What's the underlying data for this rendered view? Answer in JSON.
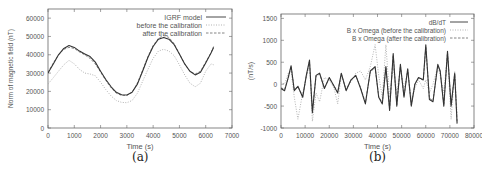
{
  "figure": {
    "panels": [
      {
        "caption": "(a)"
      },
      {
        "caption": "(b)"
      }
    ]
  },
  "chart_data": [
    {
      "type": "line",
      "panel": "(a)",
      "title": "",
      "xlabel": "Time (s)",
      "ylabel": "Norm of magnetic field (nT)",
      "xlim": [
        0,
        7000
      ],
      "ylim": [
        0,
        65000
      ],
      "xticks": [
        0,
        1000,
        2000,
        3000,
        4000,
        5000,
        6000,
        7000
      ],
      "yticks": [
        0,
        10000,
        20000,
        30000,
        40000,
        50000,
        60000
      ],
      "xtick_labels": [
        "0",
        "1000",
        "2000",
        "3000",
        "4000",
        "5000",
        "6000",
        "7000"
      ],
      "ytick_labels": [
        "0",
        "10000",
        "20000",
        "30000",
        "40000",
        "50000",
        "60000"
      ],
      "grid": false,
      "legend_position": "top-right",
      "x": [
        0,
        200,
        400,
        600,
        800,
        1000,
        1200,
        1400,
        1600,
        1800,
        2000,
        2200,
        2400,
        2600,
        2800,
        3000,
        3200,
        3400,
        3600,
        3800,
        4000,
        4200,
        4400,
        4600,
        4800,
        5000,
        5200,
        5400,
        5600,
        5800,
        6000,
        6200,
        6300
      ],
      "series": [
        {
          "name": "IGRF model",
          "style": "solid",
          "color": "#333333",
          "values": [
            30000,
            35000,
            40000,
            43500,
            45000,
            44000,
            42000,
            40500,
            39000,
            36000,
            31000,
            26500,
            22500,
            19500,
            18200,
            18000,
            19500,
            24000,
            31000,
            38500,
            44500,
            48500,
            49500,
            48500,
            45500,
            40500,
            35000,
            31000,
            29000,
            30500,
            35500,
            41000,
            44000
          ]
        },
        {
          "name": "before the calibration",
          "style": "dotted",
          "color": "#aaaaaa",
          "values": [
            24000,
            27500,
            31000,
            34500,
            37000,
            35000,
            32000,
            30000,
            29500,
            28500,
            25000,
            21000,
            17500,
            15000,
            14000,
            13800,
            15000,
            19000,
            25500,
            32000,
            38000,
            42000,
            43000,
            42000,
            39500,
            34500,
            29000,
            24500,
            22500,
            24500,
            31000,
            35000,
            34500
          ]
        },
        {
          "name": "after the calibration",
          "style": "dashed",
          "color": "#777777",
          "values": [
            30500,
            35500,
            40000,
            43000,
            44000,
            43500,
            41500,
            40000,
            38000,
            35000,
            30500,
            26000,
            22000,
            19000,
            17800,
            17800,
            19500,
            24500,
            31500,
            39000,
            45000,
            49000,
            50500,
            49500,
            46000,
            40500,
            35000,
            31000,
            29500,
            31000,
            36000,
            41000,
            44500
          ]
        }
      ]
    },
    {
      "type": "line",
      "panel": "(b)",
      "title": "",
      "xlabel": "Time (s)",
      "ylabel": "(nT/s)",
      "xlim": [
        0,
        80000
      ],
      "ylim": [
        -1000,
        1600
      ],
      "xticks": [
        0,
        10000,
        20000,
        30000,
        40000,
        50000,
        60000,
        70000,
        80000
      ],
      "yticks": [
        -1000,
        -500,
        0,
        500,
        1000,
        1500
      ],
      "xtick_labels": [
        "0",
        "10000",
        "20000",
        "30000",
        "40000",
        "50000",
        "60000",
        "70000",
        "80000"
      ],
      "ytick_labels": [
        "-1000",
        "-500",
        "0",
        "500",
        "1000",
        "1500"
      ],
      "grid": false,
      "legend_position": "top-right",
      "x": [
        0,
        1500,
        3000,
        4200,
        5500,
        7000,
        9000,
        10500,
        11800,
        13000,
        14500,
        16000,
        18000,
        20000,
        22000,
        23500,
        25000,
        27000,
        29000,
        31000,
        33000,
        35000,
        37000,
        39000,
        40500,
        42000,
        43500,
        45000,
        46500,
        48000,
        49500,
        51000,
        52500,
        54000,
        55500,
        57000,
        59000,
        60000,
        61500,
        63000,
        65000,
        66000,
        67500,
        69000,
        70500,
        72000,
        73000
      ],
      "series": [
        {
          "name": "dB/dT",
          "style": "solid",
          "color": "#333333",
          "values": [
            -100,
            -150,
            150,
            420,
            -150,
            -50,
            -300,
            200,
            550,
            -650,
            200,
            250,
            -100,
            150,
            -50,
            -200,
            250,
            -150,
            100,
            200,
            -100,
            -450,
            300,
            400,
            -300,
            -450,
            400,
            -600,
            700,
            -500,
            450,
            -300,
            350,
            -500,
            0,
            150,
            100,
            900,
            -350,
            -400,
            450,
            300,
            -500,
            750,
            -500,
            250,
            -900
          ]
        },
        {
          "name": "B x Omega (before the calibration)",
          "style": "dotted",
          "color": "#aaaaaa",
          "values": [
            50,
            0,
            250,
            300,
            -300,
            -800,
            -200,
            150,
            450,
            -850,
            -200,
            -400,
            150,
            100,
            -100,
            -450,
            200,
            -100,
            50,
            250,
            300,
            100,
            400,
            900,
            200,
            -300,
            900,
            -300,
            400,
            -200,
            350,
            -100,
            300,
            -350,
            -100,
            100,
            -100,
            100,
            -200,
            0,
            400,
            200,
            -200,
            700,
            -800,
            300,
            -700
          ]
        },
        {
          "name": "B x Omega (after the calibration)",
          "style": "dashed",
          "color": "#777777",
          "values": [
            -80,
            -120,
            130,
            400,
            -120,
            -60,
            -280,
            180,
            520,
            -600,
            180,
            230,
            -80,
            130,
            -40,
            -180,
            230,
            -130,
            90,
            190,
            -80,
            -420,
            280,
            380,
            -280,
            -420,
            380,
            -560,
            660,
            -470,
            420,
            -280,
            330,
            -470,
            10,
            140,
            90,
            850,
            -320,
            -380,
            430,
            280,
            -470,
            720,
            -470,
            230,
            -850
          ]
        }
      ]
    }
  ]
}
